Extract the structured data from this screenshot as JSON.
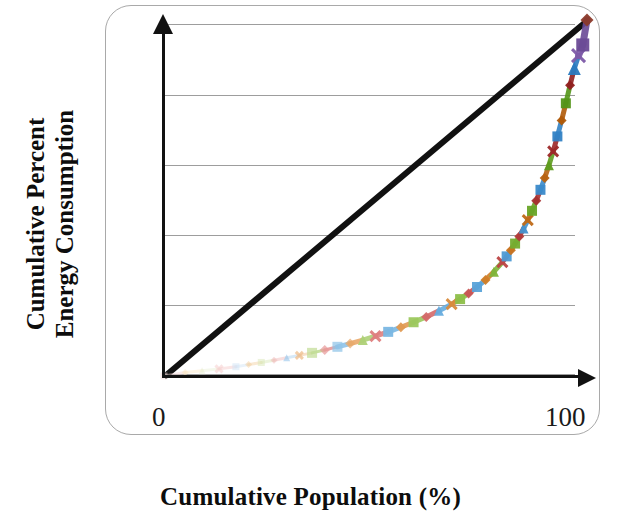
{
  "axes": {
    "x_title": "Cumulative Population (%)",
    "y_title_line1": "Cumulative Percent",
    "y_title_line2": "Energy Consumption",
    "x_tick_min": "0",
    "x_tick_max": "100"
  },
  "chart_data": {
    "type": "line",
    "title": "",
    "subtitle": "",
    "xlabel": "Cumulative Population (%)",
    "ylabel": "Cumulative Percent Energy Consumption",
    "xlim": [
      0,
      100
    ],
    "ylim": [
      0,
      100
    ],
    "grid": true,
    "grid_axis": "y",
    "gridline_values": [
      0,
      20,
      40,
      60,
      80,
      100
    ],
    "legend": false,
    "legend_position": "none",
    "annotations": [
      {
        "text": "line of perfect equality",
        "type": "reference-line",
        "from": [
          0,
          0
        ],
        "to": [
          100,
          100
        ]
      }
    ],
    "series": [
      {
        "name": "Line of perfect equality",
        "style": "solid-black-diagonal",
        "color": "#111111",
        "marker": "none",
        "x": [
          0,
          100
        ],
        "values": [
          0,
          100
        ]
      },
      {
        "name": "Lorenz curve of energy consumption",
        "style": "markers-with-segments",
        "marker": "mixed",
        "x": [
          0,
          5,
          9,
          13,
          17,
          20,
          23,
          26,
          29,
          32,
          35,
          38,
          41,
          44,
          47,
          50,
          53,
          56,
          59,
          62,
          65,
          68,
          70,
          72,
          74,
          76,
          78,
          80,
          81,
          82,
          83,
          84,
          85,
          86,
          87,
          88,
          89,
          90,
          91,
          92,
          93,
          94,
          95,
          96,
          97,
          98,
          99,
          100
        ],
        "values": [
          0,
          1,
          1.5,
          2,
          2.6,
          3.2,
          3.8,
          4.4,
          5.1,
          5.8,
          6.5,
          7.3,
          8.2,
          9.1,
          10.1,
          11.2,
          12.4,
          13.7,
          15.1,
          16.6,
          18.3,
          20.2,
          21.6,
          23.2,
          25,
          27,
          29.3,
          32,
          33.6,
          35.3,
          37.2,
          39.2,
          41.4,
          43.8,
          46.4,
          49.2,
          52.3,
          55.6,
          59.2,
          63.1,
          67.3,
          71.8,
          76.6,
          81.7,
          86.4,
          90,
          93,
          100
        ],
        "marker_colors": [
          "#f2d5d5",
          "#fbe7c4",
          "#e9f0d6",
          "#f6c9c9",
          "#cfe3f5",
          "#f3cfa0",
          "#d9e8b8",
          "#f0b8b8",
          "#a8cfee",
          "#eebb88",
          "#c2dd96",
          "#e79a9a",
          "#8fc3e8",
          "#e9a96a",
          "#aed177",
          "#de8080",
          "#7ab7e3",
          "#e09a52",
          "#9cc85e",
          "#d46a6a",
          "#66acde",
          "#d88b3c",
          "#8dbf49",
          "#c85555",
          "#5aa3d9",
          "#d07e28",
          "#7fb53a",
          "#bd4545",
          "#4e9ad4",
          "#c87320",
          "#74ad30",
          "#b23a3a",
          "#4492cf",
          "#c06a18",
          "#69a528",
          "#a73030",
          "#3b8aca",
          "#b86210",
          "#5e9d20",
          "#9c2828",
          "#3282c5",
          "#b05a08",
          "#539518",
          "#912020",
          "#2a7ac0",
          "#7d5aa8",
          "#6b4b96",
          "#8b3a2a"
        ]
      }
    ]
  }
}
